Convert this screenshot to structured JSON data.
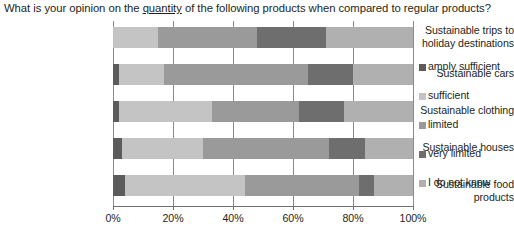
{
  "title": {
    "part1": "What is your opinion on the ",
    "emphasis": "quantity",
    "part2": " of the following products when compared to regular products?"
  },
  "legend": {
    "position": "right",
    "items": [
      {
        "label": "amply sufficient",
        "color": "#5c5c5c"
      },
      {
        "label": "sufficient",
        "color": "#c4c4c4"
      },
      {
        "label": "limited",
        "color": "#9a9a9a"
      },
      {
        "label": "very limited",
        "color": "#6e6e6e"
      },
      {
        "label": "I do not know",
        "color": "#b0b0b0"
      }
    ]
  },
  "axis": {
    "x_ticks": [
      "0%",
      "20%",
      "40%",
      "60%",
      "80%",
      "100%"
    ],
    "x_min": 0,
    "x_max": 100
  },
  "chart_data": {
    "type": "bar",
    "orientation": "horizontal",
    "stacked": true,
    "normalized_percent": true,
    "title": "What is your opinion on the quantity of the following products when compared to regular products?",
    "xlabel": "",
    "ylabel": "",
    "xlim": [
      0,
      100
    ],
    "grid": true,
    "legend_position": "right",
    "categories": [
      "Sustainable trips to holiday destinations",
      "Sustainable cars",
      "Sustainable clothing",
      "Sustainable houses",
      "Sustainable food products"
    ],
    "series": [
      {
        "name": "amply sufficient",
        "color": "#5c5c5c",
        "values": [
          0,
          2,
          2,
          3,
          4
        ]
      },
      {
        "name": "sufficient",
        "color": "#c4c4c4",
        "values": [
          15,
          15,
          31,
          27,
          40
        ]
      },
      {
        "name": "limited",
        "color": "#9a9a9a",
        "values": [
          33,
          48,
          29,
          42,
          38
        ]
      },
      {
        "name": "very limited",
        "color": "#6e6e6e",
        "values": [
          23,
          15,
          15,
          12,
          5
        ]
      },
      {
        "name": "I do not know",
        "color": "#b0b0b0",
        "values": [
          29,
          20,
          23,
          16,
          13
        ]
      }
    ]
  }
}
